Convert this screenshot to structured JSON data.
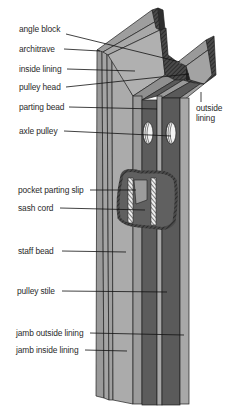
{
  "diagram": {
    "colors": {
      "background": "#ffffff",
      "light_face": "#a9a9a9",
      "mid_face": "#8c8c8c",
      "dark_channel": "#5a5a5a",
      "hatch": "#3a3a3a",
      "outline": "#1f1f1f",
      "pulley": "#e8e8e8",
      "label_text": "#2a2a2a"
    },
    "labels": [
      {
        "id": "angle-block",
        "text": "angle block",
        "x": 19,
        "y": 29
      },
      {
        "id": "architrave",
        "text": "architrave",
        "x": 19,
        "y": 44
      },
      {
        "id": "inside-lining",
        "text": "inside lining",
        "x": 19,
        "y": 64
      },
      {
        "id": "pulley-head",
        "text": "pulley head",
        "x": 19,
        "y": 82
      },
      {
        "id": "parting-bead",
        "text": "parting bead",
        "x": 19,
        "y": 102
      },
      {
        "id": "outside-lining",
        "text": "outside\nlining",
        "x": 196,
        "y": 103
      },
      {
        "id": "axle-pulley",
        "text": "axle pulley",
        "x": 19,
        "y": 126
      },
      {
        "id": "pocket-parting-slip",
        "text": "pocket parting slip",
        "x": 18,
        "y": 185
      },
      {
        "id": "sash-cord",
        "text": "sash cord",
        "x": 18,
        "y": 203
      },
      {
        "id": "staff-bead",
        "text": "staff bead",
        "x": 18,
        "y": 246
      },
      {
        "id": "pulley-stile",
        "text": "pulley stile",
        "x": 17,
        "y": 286
      },
      {
        "id": "jamb-outside-lining",
        "text": "jamb outside lining",
        "x": 16,
        "y": 328
      },
      {
        "id": "jamb-inside-lining",
        "text": "jamb inside lining",
        "x": 16,
        "y": 345
      }
    ]
  }
}
